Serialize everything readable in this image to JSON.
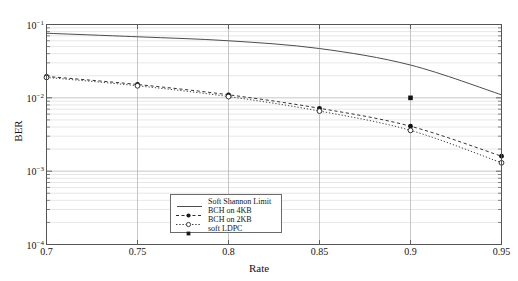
{
  "chart_data": {
    "type": "line",
    "title": "",
    "xlabel": "Rate",
    "ylabel": "BER",
    "xlim": [
      0.7,
      0.95
    ],
    "ylim": [
      0.0001,
      0.1
    ],
    "yscale": "log",
    "grid": true,
    "grid_minor": true,
    "xticks": [
      0.7,
      0.75,
      0.8,
      0.85,
      0.9,
      0.95
    ],
    "xticklabels": [
      "0.7",
      "0.75",
      "0.8",
      "0.85",
      "0.9",
      "0.95"
    ],
    "yticks": [
      0.1,
      0.01,
      0.001,
      0.0001
    ],
    "yticklabels": [
      "10-1",
      "10-2",
      "10-3",
      "10-4"
    ],
    "legend_position": "lower center",
    "series": [
      {
        "name": "Soft Shannon Limit",
        "style": "solid",
        "marker": "none",
        "color": "#4d4d4d",
        "x": [
          0.7,
          0.75,
          0.8,
          0.85,
          0.9,
          0.95
        ],
        "y": [
          0.076,
          0.068,
          0.06,
          0.047,
          0.028,
          0.011
        ]
      },
      {
        "name": "BCH on 4KB",
        "style": "dashed",
        "marker": "filled-circle",
        "color": "#2b2b2b",
        "x": [
          0.7,
          0.75,
          0.8,
          0.85,
          0.9,
          0.95
        ],
        "y": [
          0.0196,
          0.0152,
          0.011,
          0.0072,
          0.0041,
          0.0016
        ]
      },
      {
        "name": "BCH on 2KB",
        "style": "dotted",
        "marker": "open-circle",
        "color": "#3d3d3d",
        "x": [
          0.7,
          0.75,
          0.8,
          0.85,
          0.9,
          0.95
        ],
        "y": [
          0.019,
          0.0146,
          0.0104,
          0.0066,
          0.0036,
          0.0013
        ]
      },
      {
        "name": "soft LDPC",
        "style": "none",
        "marker": "filled-square",
        "color": "#1a1a1a",
        "x": [
          0.9
        ],
        "y": [
          0.01
        ]
      }
    ]
  },
  "legend": {
    "items": [
      {
        "label": "Soft Shannon Limit",
        "symbol": "solid-line"
      },
      {
        "label": "BCH on 4KB",
        "symbol": "dashed-line-filled-circle"
      },
      {
        "label": "BCH on 2KB",
        "symbol": "dotted-line-open-circle"
      },
      {
        "label": "soft LDPC",
        "symbol": "filled-square"
      }
    ]
  },
  "axes": {
    "xlabel": "Rate",
    "ylabel": "BER"
  },
  "colors": {
    "frame": "#555555",
    "grid_major": "#b8b8b8",
    "grid_minor": "#dcdcdc",
    "background": "#ffffff"
  }
}
